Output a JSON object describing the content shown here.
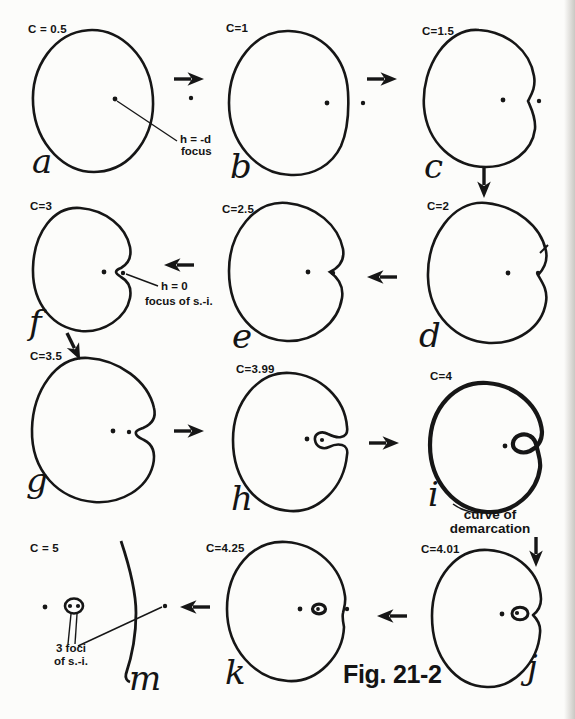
{
  "figure": {
    "caption": "Fig. 21-2"
  },
  "panels": [
    {
      "id": "a",
      "c_label": "C = 0.5",
      "letter": "a"
    },
    {
      "id": "b",
      "c_label": "C=1",
      "letter": "b"
    },
    {
      "id": "c",
      "c_label": "C=1.5",
      "letter": "c"
    },
    {
      "id": "d",
      "c_label": "C=2",
      "letter": "d"
    },
    {
      "id": "e",
      "c_label": "C=2.5",
      "letter": "e"
    },
    {
      "id": "f",
      "c_label": "C=3",
      "letter": "f"
    },
    {
      "id": "g",
      "c_label": "C=3.5",
      "letter": "g"
    },
    {
      "id": "h",
      "c_label": "C=3.99",
      "letter": "h"
    },
    {
      "id": "i",
      "c_label": "C=4",
      "letter": "i"
    },
    {
      "id": "j",
      "c_label": "C=4.01",
      "letter": "j"
    },
    {
      "id": "k",
      "c_label": "C=4.25",
      "letter": "k"
    },
    {
      "id": "m",
      "c_label": "C = 5",
      "letter": "m"
    }
  ],
  "annotations": {
    "focus_a_line1": "h = -d",
    "focus_a_line2": "focus",
    "focus_f_line1": "h = 0",
    "focus_f_line2": "focus of s.-i.",
    "demarcation_line1": "curve of",
    "demarcation_line2": "demarcation",
    "foci_m_line1": "3 foci",
    "foci_m_line2": "of s.-i."
  },
  "colors": {
    "ink": "#161616",
    "background": "#fcfcfa"
  }
}
